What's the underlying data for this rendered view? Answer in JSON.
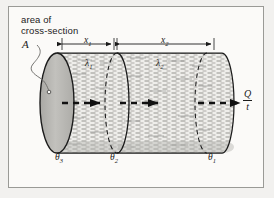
{
  "diagram": {
    "title_note": "area of cross-section",
    "annotations": {
      "area_label_line1": "area of",
      "area_label_line2": "cross-section",
      "area_symbol": "A",
      "length_first_layer": "x",
      "length_first_layer_sub": "1",
      "length_second_layer": "x",
      "length_second_layer_sub": "2",
      "conductivity_first": "λ",
      "conductivity_first_sub": "1",
      "conductivity_second": "λ",
      "conductivity_second_sub": "2",
      "temp_hot": "θ",
      "temp_hot_sub": "3",
      "temp_mid": "θ",
      "temp_mid_sub": "2",
      "temp_cold": "θ",
      "temp_cold_sub": "1",
      "heat_rate_numerator": "Q",
      "heat_rate_denominator": "t"
    },
    "colors": {
      "background": "#f2f1ef",
      "panel": "#fbfaf8",
      "border": "#9a9a96",
      "ink": "#1b1b1b",
      "face_fill": "#b9b8b4",
      "body_fill": "#efeeeb",
      "hatch": "#7d7c78"
    },
    "geometry": {
      "cylinder_left_x": 57,
      "cylinder_right_x": 222,
      "divider_x": 117,
      "back_ellipse_right_x": 207,
      "axis_y": 103,
      "ellipse_rx": 12,
      "ellipse_ry": 50
    }
  }
}
